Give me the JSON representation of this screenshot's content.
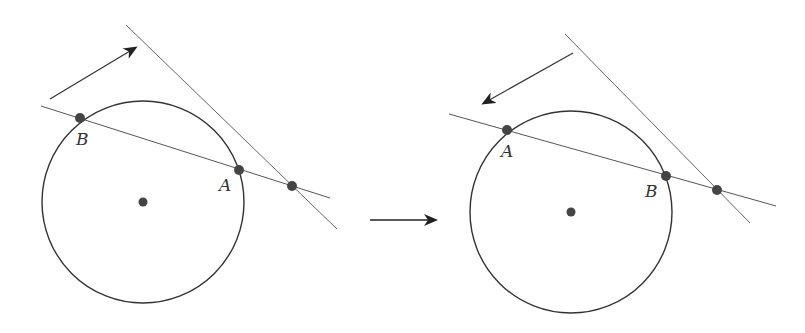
{
  "diagram": {
    "colors": {
      "stroke": "#333333",
      "thin_line": "#666666",
      "point": "#444444",
      "background": "#ffffff"
    },
    "left_panel": {
      "circle": {
        "cx": 143,
        "cy": 202,
        "r": 101
      },
      "center_point": {
        "x": 143,
        "y": 202
      },
      "secant_line": {
        "x1": 41,
        "y1": 106,
        "x2": 330,
        "y2": 198
      },
      "tangent_line": {
        "x1": 126,
        "y1": 25,
        "x2": 337,
        "y2": 229
      },
      "points": [
        {
          "label": "B",
          "x": 80,
          "y": 118,
          "label_x": 76,
          "label_y": 145
        },
        {
          "label": "A",
          "x": 239,
          "y": 170,
          "label_x": 219,
          "label_y": 191
        },
        {
          "label": "",
          "x": 292,
          "y": 186
        }
      ],
      "arrow": {
        "x1": 50,
        "y1": 99,
        "x2": 135,
        "y2": 48,
        "direction": "up-right"
      }
    },
    "right_panel": {
      "circle": {
        "cx": 571,
        "cy": 212,
        "r": 101
      },
      "center_point": {
        "x": 571,
        "y": 212
      },
      "secant_line": {
        "x1": 449,
        "y1": 114,
        "x2": 776,
        "y2": 206
      },
      "tangent_line": {
        "x1": 565,
        "y1": 34,
        "x2": 750,
        "y2": 223
      },
      "points": [
        {
          "label": "A",
          "x": 507,
          "y": 130,
          "label_x": 501,
          "label_y": 157
        },
        {
          "label": "B",
          "x": 666,
          "y": 176,
          "label_x": 645,
          "label_y": 197
        },
        {
          "label": "",
          "x": 717,
          "y": 190
        }
      ],
      "arrow": {
        "x1": 573,
        "y1": 53,
        "x2": 484,
        "y2": 103,
        "direction": "down-left"
      }
    },
    "transition_arrow": {
      "x1": 370,
      "y1": 220,
      "x2": 435,
      "y2": 220,
      "direction": "right"
    }
  }
}
